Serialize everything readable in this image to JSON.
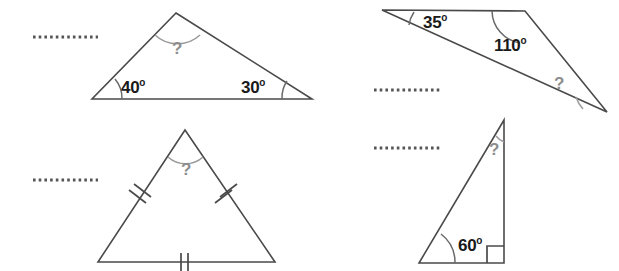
{
  "worksheet": {
    "title": "Find the missing angle in each triangle",
    "background_color": "#ffffff",
    "line_color": "#4a4a4a",
    "arc_color": "#9a9a9a",
    "label_color": "#1a1a1a",
    "question_color": "#8d8d8d",
    "degree_symbol": "o",
    "unknown_symbol": "?"
  },
  "figures": [
    {
      "id": "triangle-1",
      "position": "top-left",
      "type": "scalene-triangle",
      "answer_blank": true,
      "known_angles": [
        {
          "value": "40",
          "degree": "o",
          "vertex": "bottom-left"
        },
        {
          "value": "30",
          "degree": "o",
          "vertex": "bottom-right"
        }
      ],
      "unknown_angle": {
        "label": "?",
        "vertex": "apex"
      },
      "side_marks": []
    },
    {
      "id": "triangle-2",
      "position": "top-right",
      "type": "scalene-triangle",
      "answer_blank": true,
      "known_angles": [
        {
          "value": "35",
          "degree": "o",
          "vertex": "top-left"
        },
        {
          "value": "110",
          "degree": "o",
          "vertex": "top-right"
        }
      ],
      "unknown_angle": {
        "label": "?",
        "vertex": "bottom"
      },
      "side_marks": []
    },
    {
      "id": "triangle-3",
      "position": "bottom-left",
      "type": "equilateral-triangle",
      "answer_blank": true,
      "known_angles": [],
      "unknown_angle": {
        "label": "?",
        "vertex": "apex"
      },
      "side_marks": [
        {
          "side": "left",
          "ticks": 2
        },
        {
          "side": "right",
          "ticks": 2
        },
        {
          "side": "bottom",
          "ticks": 2
        }
      ]
    },
    {
      "id": "triangle-4",
      "position": "bottom-right",
      "type": "right-triangle",
      "answer_blank": true,
      "known_angles": [
        {
          "value": "60",
          "degree": "o",
          "vertex": "bottom-left"
        }
      ],
      "right_angle": {
        "vertex": "bottom-right",
        "value": "90",
        "marker": "square"
      },
      "unknown_angle": {
        "label": "?",
        "vertex": "apex"
      },
      "side_marks": []
    }
  ],
  "labels": {
    "a40": "40",
    "a40_deg": "o",
    "a30": "30",
    "a30_deg": "o",
    "a35": "35",
    "a35_deg": "o",
    "a110": "110",
    "a110_deg": "o",
    "a60": "60",
    "a60_deg": "o",
    "q1": "?",
    "q2": "?",
    "q3": "?",
    "q4": "?"
  },
  "answer_lines": [
    {
      "id": "answer-line-1",
      "for": "triangle-1"
    },
    {
      "id": "answer-line-2",
      "for": "triangle-3"
    },
    {
      "id": "answer-line-3",
      "for": "triangle-2"
    },
    {
      "id": "answer-line-4",
      "for": "triangle-4"
    }
  ]
}
